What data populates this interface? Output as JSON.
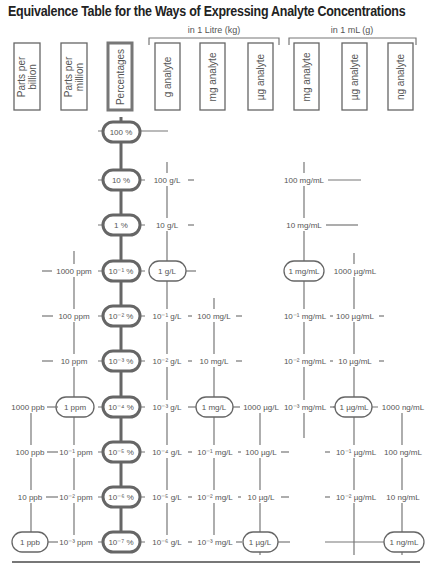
{
  "title": "Equivalence Table for the Ways of Expressing Analyte Concentrations",
  "groups": {
    "litre": "in 1 Litre (kg)",
    "ml": "in 1 mL (g)"
  },
  "headers": {
    "ppb": [
      "Parts per",
      "billion"
    ],
    "ppm": [
      "Parts per",
      "million"
    ],
    "pct": "Percentages",
    "g_analyte": "g analyte",
    "mg_analyte_l": "mg analyte",
    "ug_analyte_l": "µg analyte",
    "mg_analyte_ml": "mg analyte",
    "ug_analyte_ml": "µg analyte",
    "ng_analyte_ml": "ng analyte"
  },
  "rows": {
    "pct": [
      "100 %",
      "10 %",
      "1 %",
      "10⁻¹ %",
      "10⁻² %",
      "10⁻³ %",
      "10⁻⁴ %",
      "10⁻⁵ %",
      "10⁻⁶ %",
      "10⁻⁷ %"
    ],
    "ppb": [
      "1000 ppb",
      "100 ppb",
      "10 ppb",
      "1 ppb"
    ],
    "ppm": [
      "1000 ppm",
      "100 ppm",
      "10 ppm",
      "1 ppm",
      "10⁻¹ ppm",
      "10⁻² ppm",
      "10⁻³ ppm"
    ],
    "g_l": [
      "100 g/L",
      "10 g/L",
      "1 g/L",
      "10⁻¹ g/L",
      "10⁻² g/L",
      "10⁻³ g/L",
      "10⁻⁴ g/L",
      "10⁻⁵ g/L",
      "10⁻⁶ g/L"
    ],
    "mg_l": [
      "100 mg/L",
      "10 mg/L",
      "1 mg/L",
      "10⁻¹ mg/L",
      "10⁻² mg/L",
      "10⁻³ mg/L"
    ],
    "ug_l": [
      "1000 µg/L",
      "100 µg/L",
      "10 µg/L",
      "1 µg/L"
    ],
    "mg_ml": [
      "100 mg/mL",
      "10 mg/mL",
      "1 mg/mL",
      "10⁻¹ mg/mL",
      "10⁻² mg/mL",
      "10⁻³ mg/mL"
    ],
    "ug_ml": [
      "1000 µg/mL",
      "100 µg/mL",
      "10 µg/mL",
      "1 µg/mL",
      "10⁻¹ µg/mL",
      "10⁻² µg/mL"
    ],
    "ng_ml": [
      "1000 ng/mL",
      "100 ng/mL",
      "10 ng/mL",
      "1 ng/mL"
    ]
  }
}
